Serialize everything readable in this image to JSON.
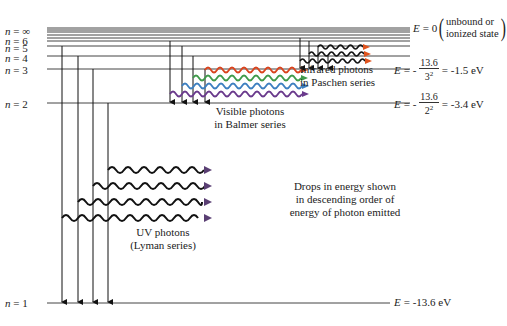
{
  "levels": [
    {
      "n": "∞",
      "label_html": "n = ∞",
      "y": 31
    },
    {
      "n": "6",
      "label_html": "n = 6",
      "y": 41
    },
    {
      "n": "5",
      "label_html": "n = 5",
      "y": 46
    },
    {
      "n": "4",
      "label_html": "n = 4",
      "y": 56
    },
    {
      "n": "3",
      "label_html": "n = 3",
      "y": 69
    },
    {
      "n": "2",
      "label_html": "n = 2",
      "y": 103
    },
    {
      "n": "1",
      "label_html": "n = 1",
      "y": 303
    }
  ],
  "level_labels": {
    "inf": "n = ∞",
    "n6": "n = 6",
    "n5": "n = 5",
    "n4": "n = 4",
    "n3": "n = 3",
    "n2": "n = 2",
    "n1": "n = 1"
  },
  "energy_labels": {
    "e0": {
      "prefix": "E",
      "value": "= 0",
      "paren_line1": "unbound or",
      "paren_line2": "ionized state"
    },
    "e3": {
      "prefix": "E",
      "eq": "= -",
      "num": "13.6",
      "den": "3",
      "exp": "2",
      "result": "= -1.5 eV"
    },
    "e2": {
      "prefix": "E",
      "eq": "= -",
      "num": "13.6",
      "den": "2",
      "exp": "2",
      "result": "= -3.4 eV"
    },
    "e1": {
      "prefix": "E",
      "result": "= -13.6 eV"
    }
  },
  "series": {
    "lyman": {
      "line1": "UV photons",
      "line2": "(Lyman series)",
      "photon_color": "#111111",
      "arrowhead_color": "#5a3f73"
    },
    "balmer": {
      "line1": "Visible photons",
      "line2": "in Balmer series",
      "photon_colors": [
        "#d9441e",
        "#3f9a4a",
        "#3d7fc0",
        "#6a3a8c"
      ]
    },
    "paschen": {
      "line1": "Infrared photons",
      "line2": "in Paschen series",
      "photon_color": "#111111",
      "arrowhead_color": "#e0541e"
    }
  },
  "note": {
    "line1": "Drops in energy shown",
    "line2": "in descending order of",
    "line3": "energy of photon emitted"
  },
  "colors": {
    "line": "#444444",
    "text": "#222222"
  }
}
